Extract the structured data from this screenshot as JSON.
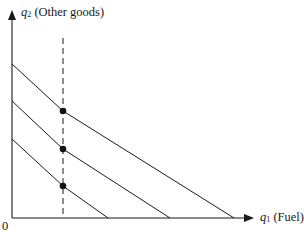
{
  "diagram": {
    "type": "budget-constraint",
    "y_axis": {
      "symbol": "q",
      "subscript": "2",
      "label": "(Other goods)"
    },
    "x_axis": {
      "symbol": "q",
      "subscript": "1",
      "label": "(Fuel)"
    },
    "origin_label": "0",
    "colors": {
      "line": "#1a1a1a",
      "background": "#ffffff"
    },
    "guide": {
      "style": "dashed",
      "x": 63,
      "y_top": 38,
      "y_bottom": 218
    },
    "budget_lines": [
      {
        "name": "outer",
        "points": [
          [
            12,
            64
          ],
          [
            63,
            111
          ],
          [
            234,
            218
          ]
        ]
      },
      {
        "name": "middle",
        "points": [
          [
            12,
            101
          ],
          [
            63,
            149
          ],
          [
            170,
            218
          ]
        ]
      },
      {
        "name": "inner",
        "points": [
          [
            12,
            139
          ],
          [
            63,
            186
          ],
          [
            108,
            218
          ]
        ]
      }
    ],
    "kink_points": [
      [
        63,
        111
      ],
      [
        63,
        149
      ],
      [
        63,
        186
      ]
    ]
  }
}
